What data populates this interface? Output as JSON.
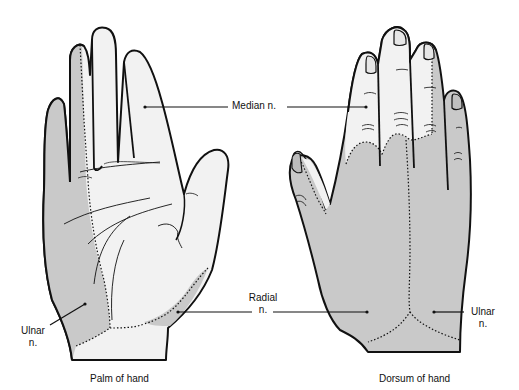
{
  "diagram": {
    "type": "anatomical-illustration",
    "colors": {
      "median_region": "#f2f2f2",
      "ulnar_radial_region": "#c9c9c9",
      "outline": "#111111",
      "background": "#ffffff"
    },
    "panels": [
      {
        "id": "palm",
        "caption": "Palm of hand",
        "regions": [
          "Median n.",
          "Ulnar n.",
          "Radial n."
        ]
      },
      {
        "id": "dorsum",
        "caption": "Dorsum of hand",
        "regions": [
          "Median n.",
          "Radial n.",
          "Ulnar n."
        ]
      }
    ],
    "labels": {
      "median": "Median n.",
      "radial_line1": "Radial",
      "radial_line2": "n.",
      "ulnar_left_line1": "Ulnar",
      "ulnar_left_line2": "n.",
      "ulnar_right_line1": "Ulnar",
      "ulnar_right_line2": "n."
    },
    "captions": {
      "palm": "Palm of hand",
      "dorsum": "Dorsum of hand"
    }
  }
}
